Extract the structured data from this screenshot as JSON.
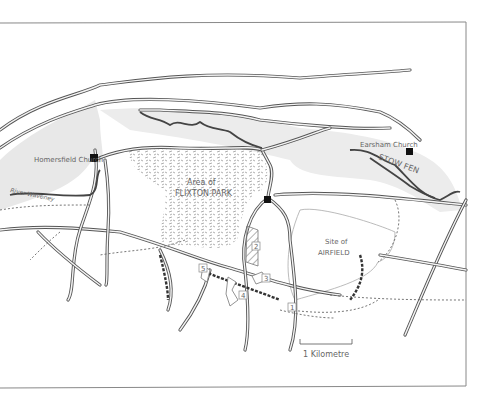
{
  "map": {
    "places": {
      "homersfield_church": "Homersfield Church",
      "earsham_church": "Earsham Church",
      "stow_fen": "STOW FEN",
      "river_waveney": "River Waveney",
      "flixton_park_line1": "Area of",
      "flixton_park_line2": "FLIXTON PARK",
      "airfield_line1": "Site of",
      "airfield_line2": "AIRFIELD"
    },
    "site_markers": [
      "1",
      "2",
      "3",
      "4",
      "5"
    ],
    "scale_bar": {
      "label": "1 Kilometre"
    },
    "colors": {
      "road": "#555555",
      "floodplain": "#e8e8e8",
      "frame": "#888888",
      "church_marker": "#111111"
    }
  }
}
